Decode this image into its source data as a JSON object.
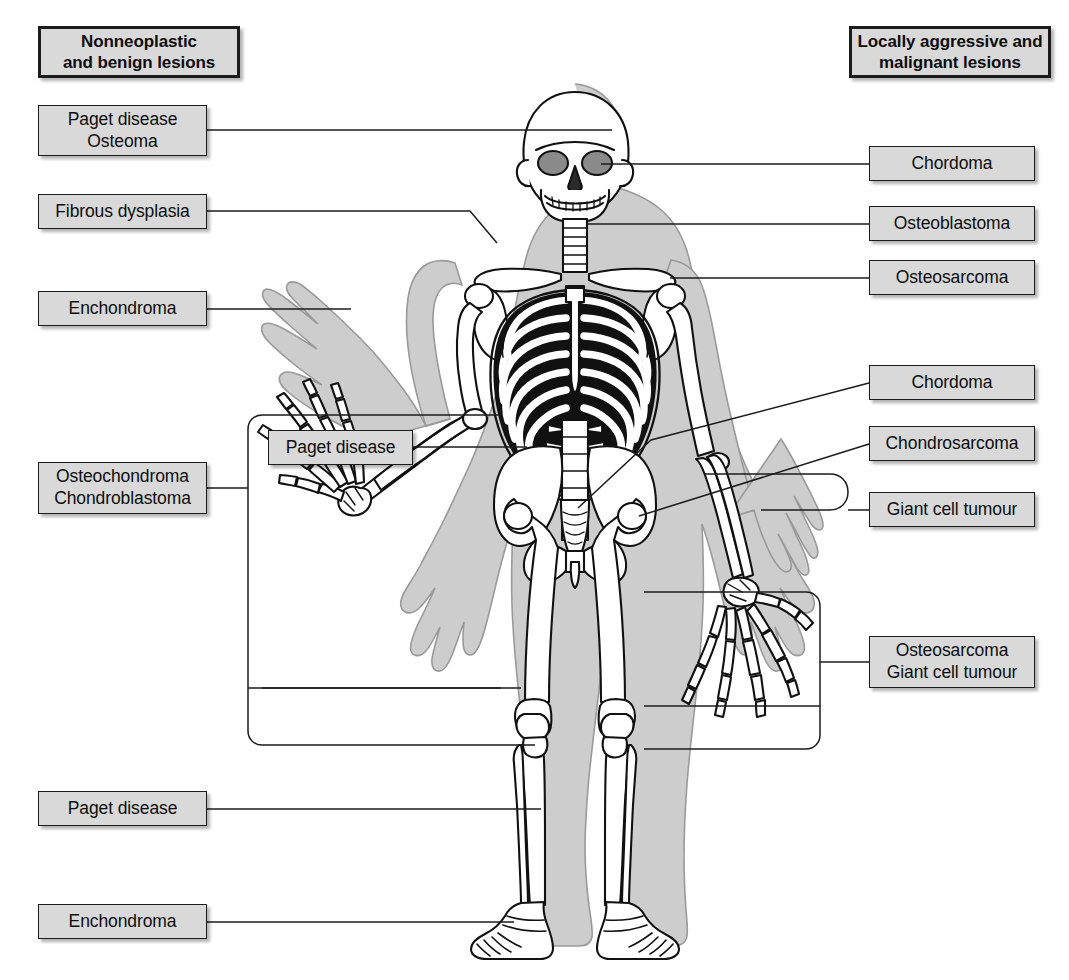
{
  "page": {
    "width": 1069,
    "height": 980,
    "background": "#ffffff"
  },
  "colors": {
    "box_fill": "#d9d9d9",
    "box_border": "#1b1b1b",
    "line": "#1b1b1b",
    "body_silhouette": "#cdcdcd",
    "bone_fill": "#ffffff",
    "bone_outline": "#111111",
    "rib_shadow": "#111111",
    "orbit_fill": "#8a8a8a",
    "text": "#0d0d0d"
  },
  "headers": {
    "left": {
      "lines": [
        "Nonneoplastic",
        "and benign lesions"
      ],
      "text": "Nonneoplastic\nand benign lesions"
    },
    "right": {
      "lines": [
        "Locally aggressive and",
        "malignant lesions"
      ],
      "text": "Locally aggressive and\nmalignant lesions"
    }
  },
  "left_labels": [
    {
      "id": "paget-osteoma",
      "text": "Paget disease\nOsteoma",
      "lines": [
        "Paget disease",
        "Osteoma"
      ],
      "target": "skull"
    },
    {
      "id": "fibrous-dysplasia",
      "text": "Fibrous dysplasia",
      "lines": [
        "Fibrous dysplasia"
      ],
      "target": "right-shoulder / proximal humerus"
    },
    {
      "id": "enchondroma-hand",
      "text": "Enchondroma",
      "lines": [
        "Enchondroma"
      ],
      "target": "right hand phalanges"
    },
    {
      "id": "osteochondroma-chondroblastoma",
      "text": "Osteochondroma\nChondroblastoma",
      "lines": [
        "Osteochondroma",
        "Chondroblastoma"
      ],
      "target": "proximal femur / distal femur / proximal tibia"
    },
    {
      "id": "paget-pelvis",
      "text": "Paget disease",
      "lines": [
        "Paget disease"
      ],
      "target": "pelvis"
    },
    {
      "id": "paget-tibia",
      "text": "Paget disease",
      "lines": [
        "Paget disease"
      ],
      "target": "tibia"
    },
    {
      "id": "enchondroma-foot",
      "text": "Enchondroma",
      "lines": [
        "Enchondroma"
      ],
      "target": "foot"
    }
  ],
  "right_labels": [
    {
      "id": "chordoma-skull",
      "text": "Chordoma",
      "lines": [
        "Chordoma"
      ],
      "target": "skull base / clivus"
    },
    {
      "id": "osteoblastoma",
      "text": "Osteoblastoma",
      "lines": [
        "Osteoblastoma"
      ],
      "target": "cervical spine"
    },
    {
      "id": "osteosarcoma-humerus",
      "text": "Osteosarcoma",
      "lines": [
        "Osteosarcoma"
      ],
      "target": "proximal humerus"
    },
    {
      "id": "chordoma-sacrum",
      "text": "Chordoma",
      "lines": [
        "Chordoma"
      ],
      "target": "sacrum"
    },
    {
      "id": "chondrosarcoma",
      "text": "Chondrosarcoma",
      "lines": [
        "Chondrosarcoma"
      ],
      "target": "pelvis / proximal femur"
    },
    {
      "id": "giant-cell-tumour",
      "text": "Giant cell tumour",
      "lines": [
        "Giant cell tumour"
      ],
      "target": "distal radius"
    },
    {
      "id": "osteosarcoma-gct-knee",
      "text": "Osteosarcoma\nGiant cell tumour",
      "lines": [
        "Osteosarcoma",
        "Giant cell tumour"
      ],
      "target": "distal femur / proximal tibia"
    }
  ],
  "figure": {
    "name": "anterior full-body human skeleton",
    "view": "anterior",
    "features": [
      "skull",
      "mandible",
      "cervical spine",
      "clavicles",
      "scapulae",
      "ribcage",
      "sternum",
      "lumbar spine",
      "pelvis",
      "sacrum",
      "femurs",
      "patellae",
      "tibiae",
      "fibulae",
      "feet",
      "humeri",
      "radii",
      "ulnae",
      "hands"
    ]
  }
}
